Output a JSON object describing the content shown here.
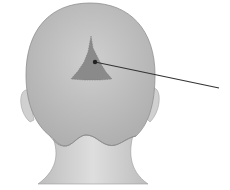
{
  "diagram": {
    "highlighted_region": "triangular scalp area at crown",
    "pointer": "leader line from region to right edge",
    "colors": {
      "background": "#ffffff",
      "head": "#c4c4c4",
      "head_shade": "#b2b2b2",
      "neck": "#d4d4d4",
      "region": "#8a8a8a",
      "line": "#333333"
    }
  }
}
